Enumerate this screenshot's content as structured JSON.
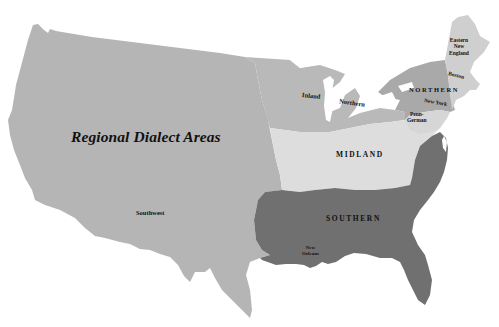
{
  "map": {
    "title": "Regional Dialect Areas",
    "regions": [
      {
        "id": "southwest",
        "label": "Southwest",
        "color": "#b5b5b5"
      },
      {
        "id": "inland-northern",
        "label_parts": [
          "Inland",
          "Northern"
        ],
        "color": "#b9b9b9"
      },
      {
        "id": "northern",
        "label": "NORTHERN",
        "color": "#a9a9a9"
      },
      {
        "id": "eastern-new-england",
        "label_lines": [
          "Eastern",
          "New",
          "England"
        ],
        "color": "#cfcfcf"
      },
      {
        "id": "midland",
        "label": "MIDLAND",
        "color": "#dddddd"
      },
      {
        "id": "penn-german",
        "label_lines": [
          "Penn-",
          "German"
        ],
        "color": "#d6d6d6"
      },
      {
        "id": "southern",
        "label": "SOUTHERN",
        "color": "#707070"
      }
    ],
    "cities": [
      {
        "id": "boston",
        "label": "Boston"
      },
      {
        "id": "new-york",
        "label": "New York"
      },
      {
        "id": "new-orleans",
        "label_lines": [
          "New",
          "Orleans"
        ]
      }
    ],
    "water_color": "#ffffff",
    "background_color": "#ffffff"
  }
}
